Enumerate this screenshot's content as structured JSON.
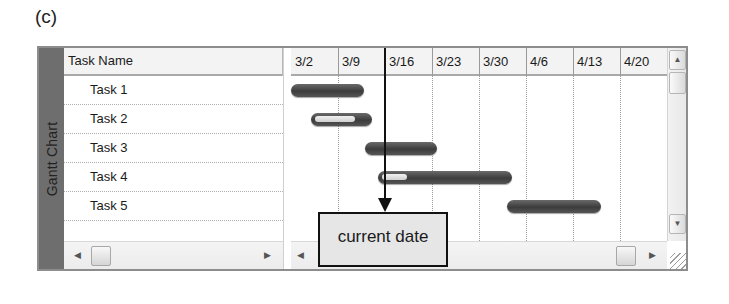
{
  "figure_label": "(c)",
  "panel": {
    "side_title": "Gantt Chart",
    "task_column_header": "Task Name",
    "tasks": [
      {
        "name": "Task 1",
        "start_col": 0.0,
        "end_col": 1.55,
        "progress": 0
      },
      {
        "name": "Task 2",
        "start_col": 0.42,
        "end_col": 1.72,
        "progress": 0.72
      },
      {
        "name": "Task 3",
        "start_col": 1.58,
        "end_col": 3.1,
        "progress": 0
      },
      {
        "name": "Task 4",
        "start_col": 1.85,
        "end_col": 4.7,
        "progress": 0.22
      },
      {
        "name": "Task 5",
        "start_col": 4.6,
        "end_col": 6.6,
        "progress": 0
      }
    ],
    "timeline_columns": [
      "3/2",
      "3/9",
      "3/16",
      "3/23",
      "3/30",
      "4/6",
      "4/13",
      "4/20"
    ],
    "current_date_col": 2.0,
    "callout_label": "current date"
  },
  "colors": {
    "bar": "#4a4a4a",
    "progress": "#e5e5e5",
    "side_band": "#6e6e6e",
    "callout_bg": "#e6e6e6"
  },
  "scrollbars": {
    "left_arrow": "◀",
    "right_arrow": "▶",
    "up_arrow": "▲",
    "down_arrow": "▼"
  }
}
